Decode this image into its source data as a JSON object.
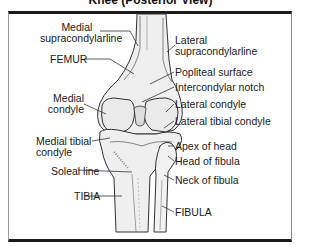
{
  "title": "Knee (Posterior View)",
  "labels": {
    "medial_supracondylar_1": "Medial",
    "medial_supracondylar_2": "supracondylarline",
    "femur": "FEMUR",
    "medial_condyle_1": "Medial",
    "medial_condyle_2": "condyle",
    "medial_tibial_condyle_1": "Medial tibial",
    "medial_tibial_condyle_2": "condyle",
    "soleal_line": "Soleal line",
    "tibia": "TIBIA",
    "lateral_supracondylar_1": "Lateral",
    "lateral_supracondylar_2": "supracondylarline",
    "popliteal_surface": "Popliteal surface",
    "intercondylar_notch": "Intercondylar notch",
    "lateral_condyle": "Lateral condyle",
    "lateral_tibial_condyle": "Lateral tibial condyle",
    "apex_of_head": "Apex of head",
    "head_of_fibula": "Head of fibula",
    "neck_of_fibula": "Neck of fibula",
    "fibula": "FIBULA"
  },
  "colors": {
    "bone_fill": "#efefef",
    "outline": "#333333",
    "leader": "#333333",
    "frame": "#1a1a1a"
  }
}
